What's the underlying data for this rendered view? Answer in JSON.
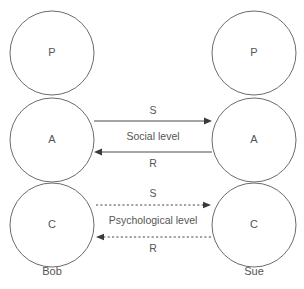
{
  "diagram": {
    "stroke_color": "#6b6b6b",
    "arrow_color": "#4a4a4a",
    "text_color": "#555555",
    "background": "#ffffff",
    "people": [
      {
        "id": "bob",
        "name": "Bob",
        "side": "left",
        "cx": 52,
        "ego_states": [
          {
            "code": "P",
            "cy": 53
          },
          {
            "code": "A",
            "cy": 140
          },
          {
            "code": "C",
            "cy": 225
          }
        ]
      },
      {
        "id": "sue",
        "name": "Sue",
        "side": "right",
        "cx": 254,
        "ego_states": [
          {
            "code": "P",
            "cy": 53
          },
          {
            "code": "A",
            "cy": 140
          },
          {
            "code": "C",
            "cy": 225
          }
        ]
      }
    ],
    "circle_radius": 42,
    "levels": [
      {
        "id": "social",
        "label": "Social level",
        "label_x": 153,
        "label_y": 137,
        "style": "solid",
        "from_state": "A",
        "to_state": "A",
        "arrows": [
          {
            "id": "social-stimulus",
            "code": "S",
            "direction": "right",
            "y": 121,
            "x_start": 94,
            "x_end": 212,
            "label_x": 153,
            "label_y": 111
          },
          {
            "id": "social-response",
            "code": "R",
            "direction": "left",
            "y": 152,
            "x_start": 212,
            "x_end": 94,
            "label_x": 153,
            "label_y": 164
          }
        ]
      },
      {
        "id": "psychological",
        "label": "Psychological level",
        "label_x": 153,
        "label_y": 221,
        "style": "dashed",
        "from_state": "C",
        "to_state": "C",
        "arrows": [
          {
            "id": "psychological-stimulus",
            "code": "S",
            "direction": "right",
            "y": 205,
            "x_start": 96,
            "x_end": 211,
            "label_x": 153,
            "label_y": 194
          },
          {
            "id": "psychological-response",
            "code": "R",
            "direction": "left",
            "y": 237,
            "x_start": 211,
            "x_end": 96,
            "label_x": 153,
            "label_y": 249
          }
        ]
      }
    ],
    "person_label_y": 272
  }
}
